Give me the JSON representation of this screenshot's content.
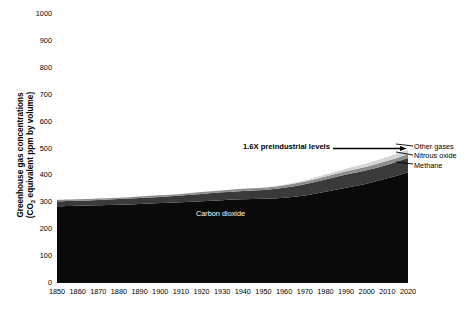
{
  "chart_data": {
    "type": "area",
    "title": "",
    "subtitle": "",
    "xlabel": "",
    "ylabel": "Greenhouse gas concentrations (CO2 equivalent ppm by volume)",
    "ylabel_line1": "Greenhouse gas concentrations",
    "ylabel_line2_pre": "(CO",
    "ylabel_line2_sub": "2",
    "ylabel_line2_post": " equivalent ppm by volume)",
    "xlim": [
      1850,
      2020
    ],
    "ylim": [
      0,
      1000
    ],
    "grid": false,
    "stacked": true,
    "legend_position": "right-annotations",
    "y_ticks": [
      0,
      100,
      200,
      300,
      400,
      500,
      600,
      700,
      800,
      900,
      1000
    ],
    "x_ticks": [
      1850,
      1860,
      1870,
      1880,
      1890,
      1900,
      1910,
      1920,
      1930,
      1940,
      1950,
      1960,
      1970,
      1980,
      1990,
      2000,
      2010,
      2020
    ],
    "x": [
      1850,
      1860,
      1870,
      1880,
      1890,
      1900,
      1910,
      1920,
      1930,
      1940,
      1950,
      1960,
      1970,
      1980,
      1990,
      2000,
      2010,
      2020
    ],
    "series": [
      {
        "name": "Carbon dioxide",
        "color": "#0a0a0a",
        "values": [
          285,
          287,
          289,
          291,
          294,
          297,
          300,
          304,
          308,
          311,
          313,
          317,
          325,
          339,
          354,
          369,
          389,
          412
        ]
      },
      {
        "name": "Methane",
        "color": "#3a3a3a",
        "values": [
          19,
          19,
          20,
          21,
          22,
          23,
          25,
          27,
          29,
          31,
          33,
          37,
          42,
          46,
          49,
          50,
          51,
          53
        ]
      },
      {
        "name": "Nitrous oxide",
        "color": "#8c8c8c",
        "values": [
          5,
          5,
          5,
          5,
          6,
          6,
          6,
          7,
          7,
          8,
          8,
          9,
          10,
          11,
          12,
          13,
          14,
          15
        ]
      },
      {
        "name": "Other gases",
        "color": "#d4d4d4",
        "values": [
          0,
          0,
          0,
          0,
          0,
          0,
          0,
          0,
          0,
          0,
          1,
          2,
          4,
          7,
          10,
          12,
          14,
          15
        ]
      }
    ],
    "annotations": [
      {
        "name": "preindustrial-multiple",
        "text": "1.6X preindustrial levels",
        "bold": true,
        "x": 2013,
        "y": 500
      },
      {
        "name": "carbon-dioxide-inline",
        "text": "Carbon dioxide",
        "color": "#ffffff",
        "x": 1920,
        "y": 275
      }
    ],
    "right_labels": [
      {
        "name": "other-gases",
        "text": "Other gases"
      },
      {
        "name": "nitrous-oxide",
        "text": "Nitrous oxide"
      },
      {
        "name": "methane",
        "text": "Methane"
      }
    ]
  }
}
